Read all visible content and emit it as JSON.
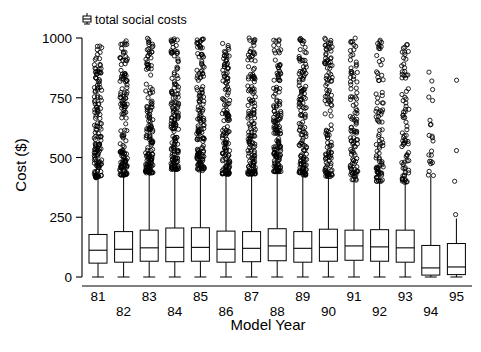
{
  "chart_data": {
    "type": "boxplot",
    "title": "",
    "xlabel": "Model Year",
    "ylabel": "Cost ($)",
    "ylim": [
      0,
      1000
    ],
    "yticks": [
      0,
      250,
      500,
      750,
      1000
    ],
    "ytick_labels": [
      "0",
      "250",
      "500",
      "750",
      "1000"
    ],
    "grid": false,
    "legend": {
      "position": "top-left-inside",
      "entries": [
        {
          "label": "total social costs",
          "marker": "boxplot-glyph"
        }
      ]
    },
    "categories": [
      "81",
      "82",
      "83",
      "84",
      "85",
      "86",
      "87",
      "88",
      "89",
      "90",
      "91",
      "92",
      "93",
      "94",
      "95"
    ],
    "xtick_labels_staggered": true,
    "series": [
      {
        "name": "total social costs",
        "boxes": [
          {
            "category": "81",
            "whisker_low": 0,
            "q1": 58,
            "median": 112,
            "q3": 178,
            "whisker_high": 415,
            "n_outliers": 150
          },
          {
            "category": "82",
            "whisker_low": 0,
            "q1": 62,
            "median": 116,
            "q3": 190,
            "whisker_high": 425,
            "n_outliers": 140
          },
          {
            "category": "83",
            "whisker_low": 0,
            "q1": 66,
            "median": 122,
            "q3": 196,
            "whisker_high": 435,
            "n_outliers": 150
          },
          {
            "category": "84",
            "whisker_low": 0,
            "q1": 64,
            "median": 124,
            "q3": 205,
            "whisker_high": 450,
            "n_outliers": 155
          },
          {
            "category": "85",
            "whisker_low": 0,
            "q1": 66,
            "median": 124,
            "q3": 206,
            "whisker_high": 445,
            "n_outliers": 150
          },
          {
            "category": "86",
            "whisker_low": 0,
            "q1": 62,
            "median": 116,
            "q3": 192,
            "whisker_high": 430,
            "n_outliers": 145
          },
          {
            "category": "87",
            "whisker_low": 0,
            "q1": 64,
            "median": 120,
            "q3": 190,
            "whisker_high": 430,
            "n_outliers": 145
          },
          {
            "category": "88",
            "whisker_low": 0,
            "q1": 68,
            "median": 130,
            "q3": 202,
            "whisker_high": 440,
            "n_outliers": 150
          },
          {
            "category": "89",
            "whisker_low": 0,
            "q1": 62,
            "median": 120,
            "q3": 190,
            "whisker_high": 425,
            "n_outliers": 140
          },
          {
            "category": "90",
            "whisker_low": 0,
            "q1": 66,
            "median": 124,
            "q3": 200,
            "whisker_high": 420,
            "n_outliers": 120
          },
          {
            "category": "91",
            "whisker_low": 0,
            "q1": 70,
            "median": 130,
            "q3": 196,
            "whisker_high": 405,
            "n_outliers": 105
          },
          {
            "category": "92",
            "whisker_low": 0,
            "q1": 66,
            "median": 126,
            "q3": 198,
            "whisker_high": 400,
            "n_outliers": 90
          },
          {
            "category": "93",
            "whisker_low": 0,
            "q1": 62,
            "median": 122,
            "q3": 196,
            "whisker_high": 395,
            "n_outliers": 80
          },
          {
            "category": "94",
            "whisker_low": 0,
            "q1": 8,
            "median": 38,
            "q3": 132,
            "whisker_high": 420,
            "n_outliers": 22
          },
          {
            "category": "95",
            "whisker_low": 0,
            "q1": 10,
            "median": 42,
            "q3": 140,
            "whisker_high": 245,
            "n_outliers": 4
          }
        ]
      }
    ]
  }
}
